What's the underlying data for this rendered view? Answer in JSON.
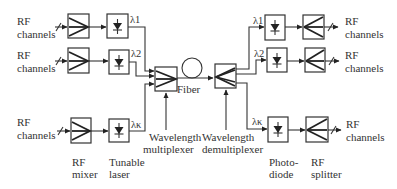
{
  "diagram": {
    "tx": {
      "channels": [
        {
          "input_label_line1": "RF",
          "input_label_line2": "channels",
          "wavelength": "λ1"
        },
        {
          "input_label_line1": "RF",
          "input_label_line2": "channels",
          "wavelength": "λ2"
        },
        {
          "input_label_line1": "RF",
          "input_label_line2": "channels",
          "wavelength": "λκ"
        }
      ],
      "mixer_label_line1": "RF",
      "mixer_label_line2": "mixer",
      "laser_label_line1": "Tunable",
      "laser_label_line2": "laser",
      "mux_label_line1": "Wavelength",
      "mux_label_line2": "multiplexer"
    },
    "fiber_label": "Fiber",
    "rx": {
      "channels": [
        {
          "output_label_line1": "RF",
          "output_label_line2": "channels",
          "wavelength": "λ1"
        },
        {
          "output_label_line1": "RF",
          "output_label_line2": "channels",
          "wavelength": "λ2"
        },
        {
          "output_label_line1": "RF",
          "output_label_line2": "channels",
          "wavelength": "λκ"
        }
      ],
      "demux_label_line1": "Wavelength",
      "demux_label_line2": "demultiplexer",
      "photodiode_label_line1": "Photo-",
      "photodiode_label_line2": "diode",
      "splitter_label_line1": "RF",
      "splitter_label_line2": "splitter"
    },
    "colors": {
      "ink": "#333333",
      "background": "#ffffff"
    }
  }
}
